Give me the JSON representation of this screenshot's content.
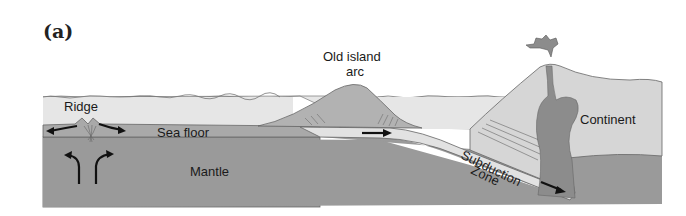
{
  "figure": {
    "panel_label": "(a)",
    "labels": {
      "ridge": "Ridge",
      "sea_floor": "Sea floor",
      "mantle": "Mantle",
      "old_island_arc_line1": "Old island",
      "old_island_arc_line2": "arc",
      "continent": "Continent",
      "subduction_line1": "Subduction",
      "subduction_line2": "Zone"
    },
    "colors": {
      "ocean": "#e6e6e6",
      "sea_floor": "#a9a9a9",
      "mantle": "#9a9a9a",
      "slab": "#e2e2e2",
      "arc": "#b2b2b2",
      "continent": "#d6d6d6",
      "magma": "#8c8c8c",
      "outline": "#5a5a5a",
      "arrow": "#111111"
    }
  }
}
